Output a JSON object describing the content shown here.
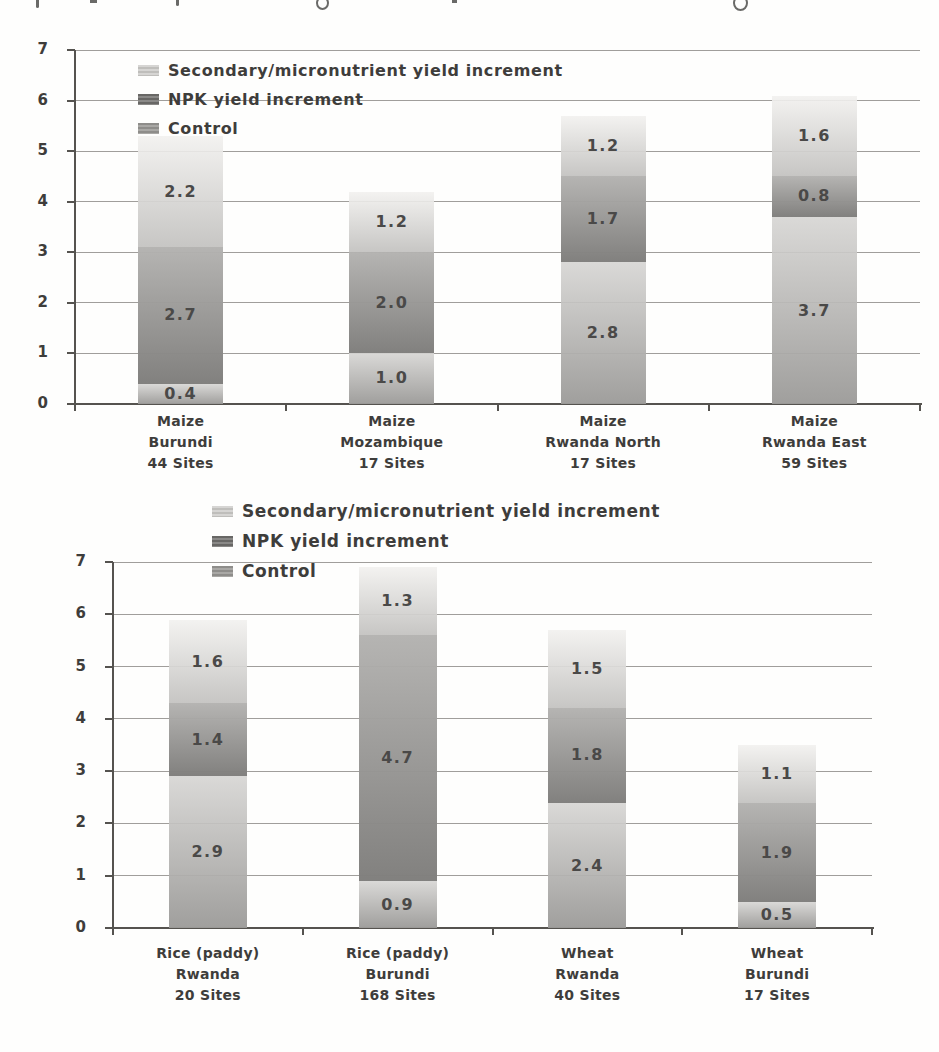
{
  "page_background": "#fefefd",
  "styles": {
    "text_color": "#3e3d3b",
    "data_label_color": "#4a4948",
    "gridline_color": "#8f8d89",
    "axis_color": "#55534f",
    "series_by_name": {
      "Control": {
        "key": "control",
        "grad_top": "rgba(214,213,211,0.90)",
        "grad_bottom": "rgba(156,155,153,0.96)",
        "swatch_a": "#8e8d8a",
        "swatch_b": "#a9a8a5"
      },
      "NPK yield increment": {
        "key": "npk",
        "grad_top": "rgba(179,178,176,0.97)",
        "grad_bottom": "rgba(127,126,124,0.98)",
        "swatch_a": "#686765",
        "swatch_b": "#8a8987"
      },
      "Secondary/micronutrient yield increment": {
        "key": "secondary",
        "grad_top": "rgba(242,241,239,0.90)",
        "grad_bottom": "rgba(196,195,193,0.95)",
        "swatch_a": "#d6d5d3",
        "swatch_b": "#bfbebb"
      }
    }
  },
  "chart_data": [
    {
      "type": "bar",
      "stacked": true,
      "title": "",
      "xlabel": "",
      "ylabel": "",
      "ylim": [
        0,
        7
      ],
      "yticks": [
        0,
        1,
        2,
        3,
        4,
        5,
        6,
        7
      ],
      "grid": true,
      "legend_position": "top-left-inside",
      "legend": [
        "Secondary/micronutrient yield increment",
        "NPK yield increment",
        "Control"
      ],
      "categories": [
        [
          "Maize",
          "Burundi",
          "44 Sites"
        ],
        [
          "Maize",
          "Mozambique",
          "17 Sites"
        ],
        [
          "Maize",
          "Rwanda North",
          "17 Sites"
        ],
        [
          "Maize",
          "Rwanda East",
          "59 Sites"
        ]
      ],
      "series": [
        {
          "name": "Control",
          "values": [
            0.4,
            1.0,
            2.8,
            3.7
          ]
        },
        {
          "name": "NPK yield increment",
          "values": [
            2.7,
            2.0,
            1.7,
            0.8
          ]
        },
        {
          "name": "Secondary/micronutrient yield increment",
          "values": [
            2.2,
            1.2,
            1.2,
            1.6
          ]
        }
      ],
      "data_labels": "one-decimal"
    },
    {
      "type": "bar",
      "stacked": true,
      "title": "",
      "xlabel": "",
      "ylabel": "",
      "ylim": [
        0,
        7
      ],
      "yticks": [
        0,
        1,
        2,
        3,
        4,
        5,
        6,
        7
      ],
      "grid": true,
      "legend_position": "top-left-inside",
      "legend": [
        "Secondary/micronutrient yield increment",
        "NPK yield increment",
        "Control"
      ],
      "categories": [
        [
          "Rice (paddy)",
          "Rwanda",
          "20 Sites"
        ],
        [
          "Rice (paddy)",
          "Burundi",
          "168 Sites"
        ],
        [
          "Wheat",
          "Rwanda",
          "40 Sites"
        ],
        [
          "Wheat",
          "Burundi",
          "17 Sites"
        ]
      ],
      "series": [
        {
          "name": "Control",
          "values": [
            2.9,
            0.9,
            2.4,
            0.5
          ]
        },
        {
          "name": "NPK yield increment",
          "values": [
            1.4,
            4.7,
            1.8,
            1.9
          ]
        },
        {
          "name": "Secondary/micronutrient yield increment",
          "values": [
            1.6,
            1.3,
            1.5,
            1.1
          ]
        }
      ],
      "data_labels": "one-decimal"
    }
  ]
}
